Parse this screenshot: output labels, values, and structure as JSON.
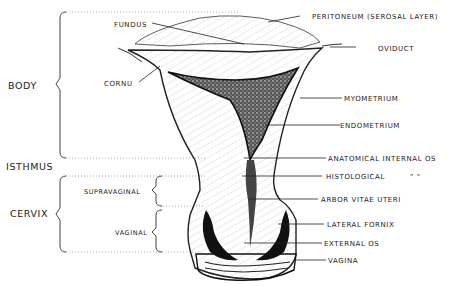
{
  "diagram": {
    "regions": {
      "body": "BODY",
      "isthmus": "ISTHMUS",
      "cervix": "CERVIX",
      "supravaginal": "SUPRAVAGINAL",
      "vaginal": "VAGINAL"
    },
    "labels": {
      "fundus": "FUNDUS",
      "cornu": "CORNU",
      "peritoneum": "PERITONEUM  (SEROSAL LAYER)",
      "oviduct": "OVIDUCT",
      "myometrium": "MYOMETRIUM",
      "endometrium": "ENDOMETRIUM",
      "anatomical_internal_os": "ANATOMICAL  INTERNAL OS",
      "histological": "HISTOLOGICAL",
      "ditto": "\"          \"",
      "arbor_vitae": "ARBOR  VITAE  UTERI",
      "lateral_fornix": "LATERAL  FORNIX",
      "external_os": "EXTERNAL  OS",
      "vagina": "VAGINA"
    }
  }
}
